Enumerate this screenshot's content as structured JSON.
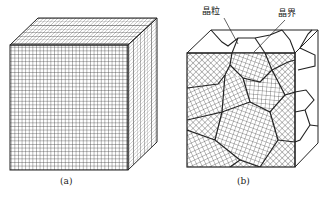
{
  "figure": {
    "panels": [
      {
        "id": "a",
        "caption": "(a)",
        "description": "single crystal cube with uniform lattice"
      },
      {
        "id": "b",
        "caption": "(b)",
        "description": "polycrystal cube with grains and grain boundaries",
        "annotations": [
          {
            "text": "晶粒",
            "meaning": "grain"
          },
          {
            "text": "晶界",
            "meaning": "grain boundary"
          }
        ]
      }
    ],
    "colors": {
      "line": "#222222",
      "background": "#ffffff"
    }
  }
}
